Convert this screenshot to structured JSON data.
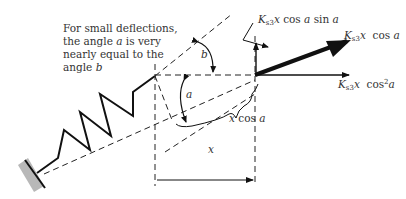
{
  "note": {
    "line1": "For small deflections,",
    "line2_pre": "the angle ",
    "line2_var": "a",
    "line2_post": " is very",
    "line3": "nearly equal to the",
    "line4_pre": "angle ",
    "line4_var": "b"
  },
  "angles": {
    "a": "a",
    "b": "b"
  },
  "dimensions": {
    "x": "x",
    "x_cos_a_var": "x",
    "x_cos_a_fn": " cos ",
    "x_cos_a_angle": "a"
  },
  "forces": {
    "vertical": {
      "k": "K",
      "sub": "s3",
      "var": "x",
      "fn1": " cos ",
      "a1": "a",
      "fn2": " sin ",
      "a2": "a"
    },
    "resultant": {
      "k": "K",
      "sub": "s3",
      "var": "x",
      "fn1": "  cos ",
      "a1": "a"
    },
    "horizontal": {
      "k": "K",
      "sub": "s3",
      "var": "x",
      "fn1": "  cos",
      "pow": "2",
      "a1": "a"
    }
  },
  "colors": {
    "stroke": "#111111",
    "text": "#333333",
    "wall": "#b8b8b8"
  }
}
